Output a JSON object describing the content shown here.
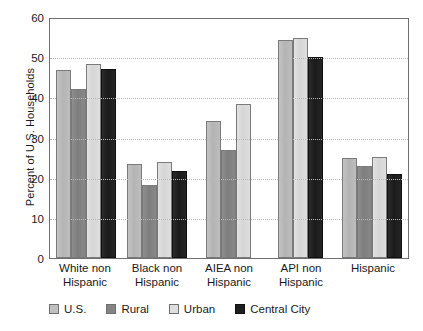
{
  "chart_data": {
    "type": "bar",
    "title": "",
    "xlabel": "",
    "ylabel": "Percent of U.S. Households",
    "ylim": [
      0,
      60
    ],
    "yticks": [
      0,
      10,
      20,
      30,
      40,
      50,
      60
    ],
    "grid": true,
    "legend_position": "bottom",
    "categories": [
      "White non Hispanic",
      "Black non Hispanic",
      "AIEA non Hispanic",
      "API non Hispanic",
      "Hispanic"
    ],
    "category_lines": [
      [
        "White non",
        "Hispanic"
      ],
      [
        "Black non",
        "Hispanic"
      ],
      [
        "AIEA non",
        "Hispanic"
      ],
      [
        "API non",
        "Hispanic"
      ],
      [
        "Hispanic",
        ""
      ]
    ],
    "series": [
      {
        "name": "U.S.",
        "color": "#c0c0c0",
        "values": [
          46.8,
          23.5,
          34.2,
          54.3,
          25.0
        ]
      },
      {
        "name": "Rural",
        "color": "#848484",
        "values": [
          42.0,
          18.3,
          26.8,
          null,
          22.8
        ]
      },
      {
        "name": "Urban",
        "color": "#dedede",
        "values": [
          48.3,
          23.8,
          38.3,
          54.8,
          25.2
        ]
      },
      {
        "name": "Central City",
        "color": "#1e1e1e",
        "values": [
          47.0,
          21.7,
          null,
          50.0,
          20.9
        ]
      }
    ]
  }
}
